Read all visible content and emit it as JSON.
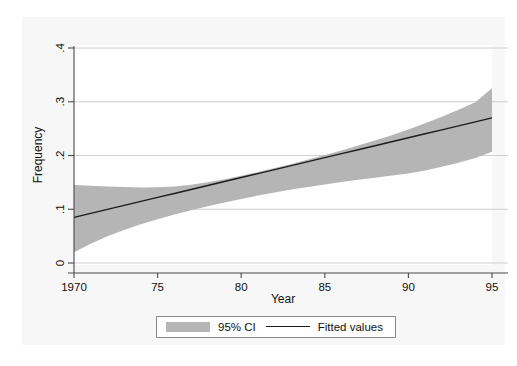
{
  "chart_data": {
    "type": "line",
    "title": "",
    "subtitle": "",
    "xlabel": "Year",
    "ylabel": "Frequency",
    "xlim": [
      1970,
      1995
    ],
    "ylim": [
      0,
      0.4
    ],
    "xticks": [
      1970,
      1975,
      1980,
      1985,
      1990,
      1995
    ],
    "xticklabels": [
      "1970",
      "75",
      "80",
      "85",
      "90",
      "95"
    ],
    "yticks": [
      0,
      0.1,
      0.2,
      0.3,
      0.4
    ],
    "yticklabels": [
      "0",
      ".1",
      ".2",
      ".3",
      ".4"
    ],
    "grid": "horizontal",
    "legend_position": "below-plot",
    "legend": [
      {
        "label": "95% CI",
        "marker": "filled-band",
        "color": "#b5b5b5"
      },
      {
        "label": "Fitted values",
        "marker": "line",
        "color": "#1c1c1c"
      }
    ],
    "series": [
      {
        "name": "Fitted values",
        "type": "line",
        "color": "#1c1c1c",
        "x": [
          1970,
          1971,
          1972,
          1973,
          1974,
          1975,
          1976,
          1977,
          1978,
          1979,
          1980,
          1981,
          1982,
          1983,
          1984,
          1985,
          1986,
          1987,
          1988,
          1989,
          1990,
          1991,
          1992,
          1993,
          1994,
          1995
        ],
        "values": [
          0.085,
          0.0924,
          0.0998,
          0.1072,
          0.1146,
          0.122,
          0.1294,
          0.1368,
          0.1442,
          0.1516,
          0.159,
          0.1664,
          0.1738,
          0.1812,
          0.1886,
          0.196,
          0.2034,
          0.2108,
          0.2182,
          0.2256,
          0.233,
          0.2404,
          0.2478,
          0.2552,
          0.2626,
          0.27
        ]
      },
      {
        "name": "95% CI",
        "type": "band",
        "color": "#b5b5b5",
        "x": [
          1970,
          1971,
          1972,
          1973,
          1974,
          1975,
          1976,
          1977,
          1978,
          1979,
          1980,
          1981,
          1982,
          1983,
          1984,
          1985,
          1986,
          1987,
          1988,
          1989,
          1990,
          1991,
          1992,
          1993,
          1994,
          1995
        ],
        "upper": [
          0.145,
          0.1436,
          0.1424,
          0.1412,
          0.1406,
          0.1408,
          0.1424,
          0.1456,
          0.1502,
          0.1558,
          0.1622,
          0.1692,
          0.1766,
          0.1844,
          0.1924,
          0.2008,
          0.2094,
          0.2184,
          0.2278,
          0.2378,
          0.2484,
          0.2598,
          0.272,
          0.2852,
          0.299,
          0.325
        ],
        "lower": [
          0.02,
          0.0358,
          0.0496,
          0.0616,
          0.0722,
          0.0816,
          0.0902,
          0.0982,
          0.1056,
          0.1126,
          0.1192,
          0.1254,
          0.1312,
          0.1366,
          0.1416,
          0.1462,
          0.1506,
          0.1548,
          0.1588,
          0.1626,
          0.1664,
          0.1722,
          0.179,
          0.1866,
          0.1952,
          0.207
        ]
      }
    ]
  },
  "colors": {
    "ci_band": "#b5b5b5",
    "fitted_line": "#1c1c1c",
    "gridline": "#c9c9c9",
    "axis": "#4a4a4a",
    "panel_background": "#f7f7f7",
    "plot_background": "#ffffff"
  }
}
